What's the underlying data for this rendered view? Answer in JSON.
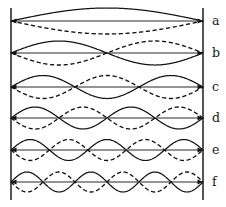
{
  "figure": {
    "background_color": "#ffffff",
    "line_color": "#141414",
    "boundary_color": "#2b2b2b"
  },
  "geometry": {
    "width": 226,
    "height": 207,
    "left_boundary_x": 11,
    "right_boundary_x": 203,
    "boundary_top_y": 8,
    "boundary_bottom_y": 200,
    "string_length": 192
  },
  "chart_data": {
    "type": "line",
    "xlabel": "",
    "ylabel": "",
    "grid": false,
    "legend_position": "none",
    "x": [
      0,
      1
    ],
    "axis_ranges": {
      "x": [
        0,
        1
      ],
      "y": [
        -1,
        1
      ]
    },
    "series": [
      {
        "name": "a",
        "label": "a",
        "harmonic": 1,
        "antinodes": 1,
        "nodes": 2,
        "wavelength_fraction": 2.0,
        "amplitude_px": 13,
        "center_y": 21,
        "solid": "sin(1*pi*x)",
        "dashed": "-sin(1*pi*x)"
      },
      {
        "name": "b",
        "label": "b",
        "harmonic": 2,
        "antinodes": 2,
        "nodes": 3,
        "wavelength_fraction": 1.0,
        "amplitude_px": 12,
        "center_y": 53,
        "solid": "sin(2*pi*x)",
        "dashed": "-sin(2*pi*x)"
      },
      {
        "name": "c",
        "label": "c",
        "harmonic": 3,
        "antinodes": 3,
        "nodes": 4,
        "wavelength_fraction": 0.667,
        "amplitude_px": 11.5,
        "center_y": 87,
        "solid": "sin(3*pi*x)",
        "dashed": "-sin(3*pi*x)"
      },
      {
        "name": "d",
        "label": "d",
        "harmonic": 4,
        "antinodes": 4,
        "nodes": 5,
        "wavelength_fraction": 0.5,
        "amplitude_px": 11,
        "center_y": 118,
        "solid": "sin(4*pi*x)",
        "dashed": "-sin(4*pi*x)"
      },
      {
        "name": "e",
        "label": "e",
        "harmonic": 5,
        "antinodes": 5,
        "nodes": 6,
        "wavelength_fraction": 0.4,
        "amplitude_px": 10.5,
        "center_y": 150,
        "solid": "sin(5*pi*x)",
        "dashed": "-sin(5*pi*x)"
      },
      {
        "name": "f",
        "label": "f",
        "harmonic": 6,
        "antinodes": 6,
        "nodes": 7,
        "wavelength_fraction": 0.3333,
        "amplitude_px": 10,
        "center_y": 182,
        "solid": "sin(6*pi*x)",
        "dashed": "-sin(6*pi*x)"
      }
    ]
  },
  "labels": {
    "column_x": 212,
    "items": [
      {
        "text": "a",
        "y": 25
      },
      {
        "text": "b",
        "y": 57
      },
      {
        "text": "c",
        "y": 91
      },
      {
        "text": "d",
        "y": 122
      },
      {
        "text": "e",
        "y": 154
      },
      {
        "text": "f",
        "y": 186
      }
    ]
  }
}
